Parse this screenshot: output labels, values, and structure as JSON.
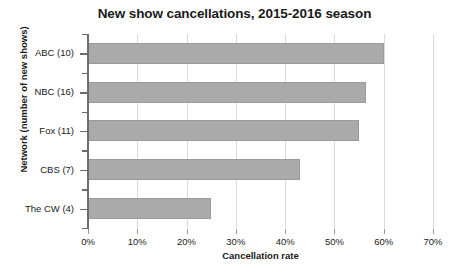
{
  "chart_data": {
    "type": "bar",
    "orientation": "horizontal",
    "title": "New show cancellations, 2015-2016 season",
    "xlabel": "Cancellation rate",
    "ylabel": "Network (number of new shows)",
    "categories": [
      "ABC (10)",
      "NBC (16)",
      "Fox (11)",
      "CBS (7)",
      "The CW (4)"
    ],
    "values": [
      60,
      56.5,
      55,
      43,
      25
    ],
    "value_suffix": "%",
    "xlim": [
      0,
      70
    ],
    "xticks": [
      0,
      10,
      20,
      30,
      40,
      50,
      60,
      70
    ],
    "xtick_labels": [
      "0%",
      "10%",
      "20%",
      "30%",
      "40%",
      "50%",
      "60%",
      "70%"
    ],
    "grid": true,
    "grid_axis": "x",
    "legend": false,
    "bar_color": "#abaaaa",
    "bar_edge_color": "#9a9a9a",
    "gridline_color": "#d9d9d9",
    "axis_color": "#6b6b6b"
  },
  "axis": {
    "y_title": "Network (number of new shows)",
    "x_title": "Cancellation rate"
  }
}
